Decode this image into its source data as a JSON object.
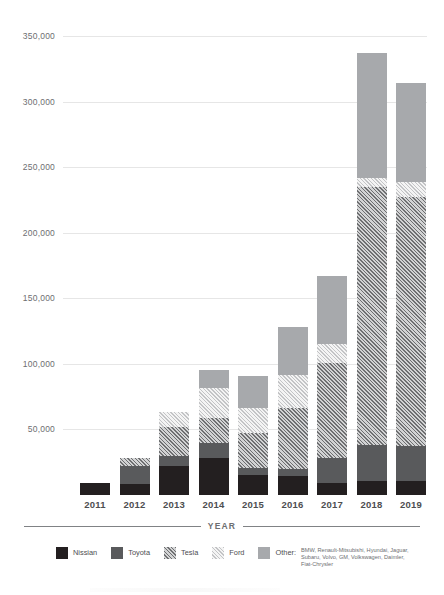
{
  "chart_data": {
    "type": "bar",
    "stacked": true,
    "title": "",
    "xlabel": "YEAR",
    "ylabel": "",
    "categories": [
      "2011",
      "2012",
      "2013",
      "2014",
      "2015",
      "2016",
      "2017",
      "2018",
      "2019"
    ],
    "ylim": [
      0,
      350000
    ],
    "yticks": [
      50000,
      100000,
      150000,
      200000,
      250000,
      300000,
      350000
    ],
    "ytick_labels": [
      "50,000",
      "100,000",
      "150,000",
      "200,000",
      "250,000",
      "300,000",
      "350,000"
    ],
    "grid": true,
    "legend_position": "bottom",
    "series": [
      {
        "name": "Nissian",
        "color": "#231f20",
        "pattern": "solid",
        "values": [
          9000,
          8500,
          22000,
          28000,
          15000,
          14500,
          9000,
          10500,
          10500
        ]
      },
      {
        "name": "Toyota",
        "color": "#595a5c",
        "pattern": "solid",
        "values": [
          0,
          14000,
          7500,
          11500,
          5500,
          5500,
          19000,
          27500,
          27000
        ]
      },
      {
        "name": "Tesla",
        "color": "#6e6f71",
        "pattern": "diagonal-hatch-dark",
        "values": [
          0,
          6000,
          22000,
          19000,
          26500,
          46500,
          72500,
          196500,
          190000
        ]
      },
      {
        "name": "Ford",
        "color": "#c3c4c6",
        "pattern": "diagonal-hatch-light",
        "values": [
          0,
          0,
          11500,
          23000,
          19000,
          25000,
          15000,
          7000,
          11000
        ]
      },
      {
        "name": "Other",
        "color": "#a7a9ac",
        "pattern": "solid",
        "values": [
          0,
          0,
          0,
          13500,
          25000,
          37000,
          51500,
          95500,
          75500
        ]
      }
    ],
    "totals": [
      9000,
      28500,
      63000,
      95000,
      91000,
      128500,
      167000,
      337000,
      314000
    ]
  },
  "legend": {
    "items": [
      {
        "label": "Nissian",
        "swatch": "nissian-swatch"
      },
      {
        "label": "Toyota",
        "swatch": "toyota-swatch"
      },
      {
        "label": "Tesla",
        "swatch": "tesla-swatch"
      },
      {
        "label": "Ford",
        "swatch": "ford-swatch"
      }
    ],
    "other": {
      "label": "Other:",
      "brands": "BMW, Renault-Mitsubishi, Hyundai, Jaguar, Subaru, Volvo, GM, Volkswagen, Daimler, Fiat-Chrysler"
    }
  },
  "axis": {
    "caption": "YEAR"
  }
}
